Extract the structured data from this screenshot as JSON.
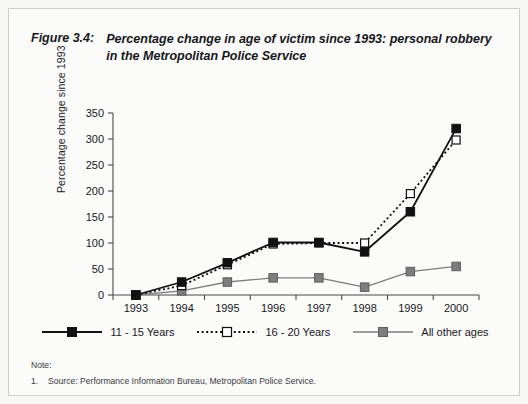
{
  "figure": {
    "label": "Figure 3.4:",
    "title": "Percentage change in age of victim since 1993: personal robbery in the Metropolitan Police Service"
  },
  "note": {
    "heading": "Note:",
    "items": [
      {
        "number": "1.",
        "text": "Source: Performance Information Bureau, Metropolitan Police Service."
      }
    ]
  },
  "colors": {
    "series_11_15": "#111111",
    "series_16_20": "#ffffff",
    "series_16_20_edge": "#111111",
    "series_other": "#7d7d7d",
    "axis": "#4a4a4a",
    "paper": "#fbfbfa"
  },
  "chart_data": {
    "type": "line",
    "title": "Percentage change in age of victim since 1993: personal robbery in the Metropolitan Police Service",
    "xlabel": "",
    "ylabel": "Percentage change since 1993",
    "categories": [
      "1993",
      "1994",
      "1995",
      "1996",
      "1997",
      "1998",
      "1999",
      "2000"
    ],
    "ylim": [
      0,
      350
    ],
    "yticks": [
      0,
      50,
      100,
      150,
      200,
      250,
      300,
      350
    ],
    "ytick_labels": [
      "0",
      "50",
      "100",
      "150",
      "200",
      "250",
      "300",
      "350"
    ],
    "grid": false,
    "legend_position": "bottom",
    "series": [
      {
        "name": "11 - 15 Years",
        "values": [
          0,
          25,
          62,
          101,
          101,
          83,
          160,
          320
        ],
        "line_style": "solid",
        "marker": "filled-square",
        "color": "#111111"
      },
      {
        "name": "16 - 20 Years",
        "values": [
          0,
          18,
          58,
          98,
          100,
          100,
          195,
          298
        ],
        "line_style": "dotted",
        "marker": "open-square",
        "color": "#111111"
      },
      {
        "name": "All other ages",
        "values": [
          0,
          8,
          25,
          33,
          33,
          15,
          45,
          55
        ],
        "line_style": "solid",
        "marker": "filled-square",
        "color": "#7d7d7d"
      }
    ]
  }
}
